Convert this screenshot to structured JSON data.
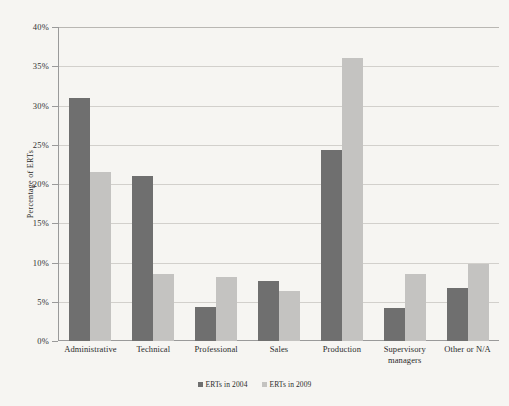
{
  "chart_data": {
    "type": "bar",
    "title": "",
    "xlabel": "",
    "ylabel": "Percentage of ERTs",
    "ylim": [
      0,
      40
    ],
    "ytick_step": 5,
    "ytick_labels": [
      "0%",
      "5%",
      "10%",
      "15%",
      "20%",
      "25%",
      "30%",
      "35%",
      "40%"
    ],
    "grid": true,
    "legend_position": "bottom",
    "categories": [
      "Administrative",
      "Technical",
      "Professional",
      "Sales",
      "Production",
      "Supervisory managers",
      "Other or N/A"
    ],
    "series": [
      {
        "name": "ERTs in 2004",
        "color": "#6f6f6f",
        "values": [
          31.0,
          21.0,
          4.3,
          7.6,
          24.3,
          4.2,
          6.7
        ]
      },
      {
        "name": "ERTs in 2009",
        "color": "#c4c3c1",
        "values": [
          21.5,
          8.5,
          8.2,
          6.4,
          36.0,
          8.5,
          9.8
        ]
      }
    ]
  },
  "legend": {
    "items": [
      {
        "label": "ERTs in 2004",
        "swatch": "legend-swatch-2004"
      },
      {
        "label": "ERTs in 2009",
        "swatch": "legend-swatch-2009"
      }
    ]
  },
  "colors": {
    "background": "#f6f5f2",
    "axis": "#9a9a9a",
    "gridline": "#d2d0cc",
    "series_2004": "#6f6f6f",
    "series_2009": "#c4c3c1"
  }
}
